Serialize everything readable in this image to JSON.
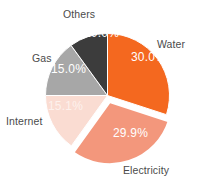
{
  "chart_data": {
    "type": "pie",
    "title": "",
    "subtitle": "",
    "xlabel": "",
    "ylabel": "",
    "legend_position": "none",
    "grid": false,
    "start_angle_deg": 0,
    "direction": "clockwise",
    "categories": [
      "Water",
      "Electricity",
      "Internet",
      "Gas",
      "Others"
    ],
    "values": [
      30.0,
      29.9,
      15.1,
      15.0,
      10.0
    ],
    "value_labels": [
      "30.0%",
      "29.9%",
      "15.1%",
      "15.0%",
      "10.0%"
    ],
    "colors": [
      "#f4681f",
      "#f3977c",
      "#fadcd2",
      "#a7a7a7",
      "#3c3c3c"
    ],
    "exploded": [
      "Electricity"
    ],
    "slices": [
      {
        "name": "Water",
        "label": "Water",
        "value": 30.0,
        "value_label": "30.0%",
        "color": "#f4681f",
        "exploded": false
      },
      {
        "name": "Electricity",
        "label": "Electricity",
        "value": 29.9,
        "value_label": "29.9%",
        "color": "#f3977c",
        "exploded": true
      },
      {
        "name": "Internet",
        "label": "Internet",
        "value": 15.1,
        "value_label": "15.1%",
        "color": "#fadcd2",
        "exploded": false
      },
      {
        "name": "Gas",
        "label": "Gas",
        "value": 15.0,
        "value_label": "15.0%",
        "color": "#a7a7a7",
        "exploded": false
      },
      {
        "name": "Others",
        "label": "Others",
        "value": 10.0,
        "value_label": "10.0%",
        "color": "#3c3c3c",
        "exploded": false
      }
    ]
  },
  "style": {
    "background": "#ffffff",
    "label_color": "#4b4b4b",
    "value_label_color": "#ffffff",
    "separator_color": "#ffffff"
  }
}
